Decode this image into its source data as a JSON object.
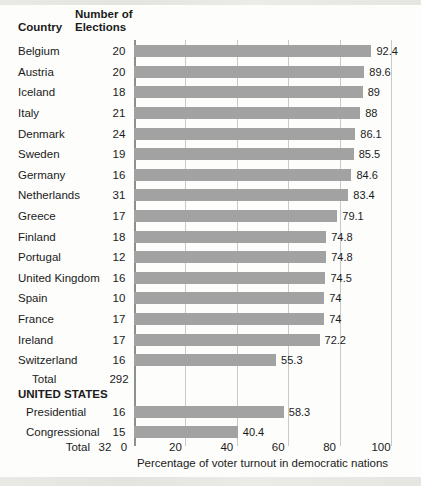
{
  "chart_data": {
    "type": "bar",
    "title": "",
    "xlabel": "Percentage of voter turnout in democratic nations",
    "xlim": [
      0,
      100
    ],
    "xticks": [
      0,
      20,
      40,
      60,
      80,
      100
    ],
    "grid": true,
    "bar_color": "#a2a2a2",
    "grid_color": "#c9c9c9",
    "col_headers": {
      "country": "Country",
      "elections_line1": "Number of",
      "elections_line2": "Elections"
    },
    "rows": [
      {
        "type": "country",
        "label": "Belgium",
        "elections": "20",
        "value": 92.4,
        "display": "92.4"
      },
      {
        "type": "country",
        "label": "Austria",
        "elections": "20",
        "value": 89.6,
        "display": "89.6"
      },
      {
        "type": "country",
        "label": "Iceland",
        "elections": "18",
        "value": 89,
        "display": "89"
      },
      {
        "type": "country",
        "label": "Italy",
        "elections": "21",
        "value": 88,
        "display": "88"
      },
      {
        "type": "country",
        "label": "Denmark",
        "elections": "24",
        "value": 86.1,
        "display": "86.1"
      },
      {
        "type": "country",
        "label": "Sweden",
        "elections": "19",
        "value": 85.5,
        "display": "85.5"
      },
      {
        "type": "country",
        "label": "Germany",
        "elections": "16",
        "value": 84.6,
        "display": "84.6"
      },
      {
        "type": "country",
        "label": "Netherlands",
        "elections": "31",
        "value": 83.4,
        "display": "83.4"
      },
      {
        "type": "country",
        "label": "Greece",
        "elections": "17",
        "value": 79.1,
        "display": "79.1"
      },
      {
        "type": "country",
        "label": "Finland",
        "elections": "18",
        "value": 74.8,
        "display": "74.8"
      },
      {
        "type": "country",
        "label": "Portugal",
        "elections": "12",
        "value": 74.8,
        "display": "74.8"
      },
      {
        "type": "country",
        "label": "United Kingdom",
        "elections": "16",
        "value": 74.5,
        "display": "74.5"
      },
      {
        "type": "country",
        "label": "Spain",
        "elections": "10",
        "value": 74,
        "display": "74"
      },
      {
        "type": "country",
        "label": "France",
        "elections": "17",
        "value": 74,
        "display": "74"
      },
      {
        "type": "country",
        "label": "Ireland",
        "elections": "17",
        "value": 72.2,
        "display": "72.2"
      },
      {
        "type": "country",
        "label": "Switzerland",
        "elections": "16",
        "value": 55.3,
        "display": "55.3"
      },
      {
        "type": "subtotal",
        "label": "Total",
        "elections": "292",
        "value": null,
        "display": ""
      },
      {
        "type": "section",
        "label": "UNITED STATES",
        "elections": "",
        "value": null,
        "display": ""
      },
      {
        "type": "us",
        "label": "Presidential",
        "elections": "16",
        "value": 58.3,
        "display": "58.3"
      },
      {
        "type": "us",
        "label": "Congressional",
        "elections": "15",
        "value": 40.4,
        "display": "40.4"
      }
    ],
    "footer_total": {
      "label": "Total",
      "value": "32"
    }
  }
}
